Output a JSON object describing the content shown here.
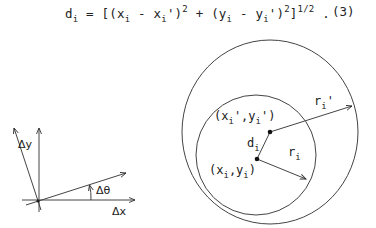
{
  "equation": {
    "lhs": "d",
    "lhs_sub": "i",
    "eq": " = [(x",
    "x_sub": "i",
    "mid1": " - x",
    "xp_sub": "i",
    "mid2": "')",
    "sq1": "2",
    "plus": " + (y",
    "y_sub": "i",
    "mid3": " - y",
    "yp_sub": "i",
    "mid4": "')",
    "sq2": "2",
    "close": "]",
    "power": "1/2",
    "period": " .",
    "number": "(3)"
  },
  "left_diagram": {
    "labels": {
      "delta_y": "Δy",
      "delta_theta": "Δθ",
      "delta_x": "Δx"
    }
  },
  "right_diagram": {
    "labels": {
      "point_prime": {
        "a": "(x",
        "a_sub": "i",
        "b": "',y",
        "b_sub": "i",
        "c": "')"
      },
      "point": {
        "a": "(x",
        "a_sub": "i",
        "b": ",y",
        "b_sub": "i",
        "c": ")"
      },
      "d": {
        "t": "d",
        "sub": "i"
      },
      "r": {
        "t": "r",
        "sub": "i"
      },
      "r_prime": {
        "t": "r",
        "sub": "i",
        "prime": "'"
      }
    }
  }
}
